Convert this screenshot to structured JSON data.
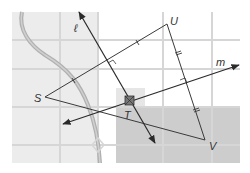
{
  "diagram": {
    "type": "geometry-map",
    "points": {
      "S": {
        "label": "S",
        "x": 45,
        "y": 97
      },
      "U": {
        "label": "U",
        "x": 167,
        "y": 24
      },
      "V": {
        "label": "V",
        "x": 205,
        "y": 140
      },
      "T": {
        "label": "T",
        "x": 130,
        "y": 101
      }
    },
    "lines": {
      "l": {
        "label": "ℓ",
        "from": [
          79,
          12
        ],
        "to": [
          155,
          143
        ]
      },
      "m": {
        "label": "m",
        "from": [
          63,
          124
        ],
        "to": [
          239,
          65
        ]
      }
    },
    "colors": {
      "map_light": "#ececec",
      "map_dark": "#c9c9c9",
      "street": "#d4d4d4",
      "river": "#a8a8a8",
      "lines": "#333333"
    }
  }
}
